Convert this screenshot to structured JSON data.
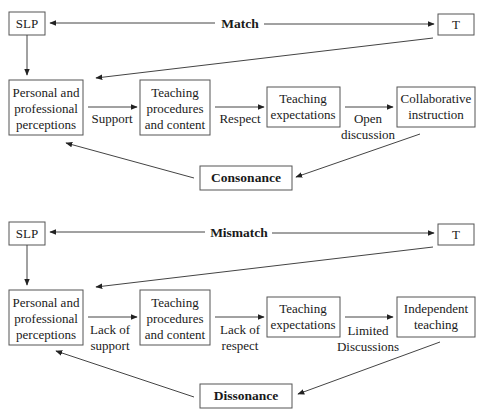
{
  "diagrams": [
    {
      "id": "match",
      "slp": "SLP",
      "t": "T",
      "relation": "Match",
      "nodes": [
        {
          "lines": [
            "Personal and",
            "professional",
            "perceptions"
          ]
        },
        {
          "lines": [
            "Teaching",
            "procedures",
            "and content"
          ]
        },
        {
          "lines": [
            "Teaching",
            "expectations"
          ]
        },
        {
          "lines": [
            "Collaborative",
            "instruction"
          ]
        }
      ],
      "edge_labels": [
        {
          "lines": [
            "Support"
          ]
        },
        {
          "lines": [
            "Respect"
          ]
        },
        {
          "lines": [
            "Open",
            "discussion"
          ]
        }
      ],
      "outcome": "Consonance"
    },
    {
      "id": "mismatch",
      "slp": "SLP",
      "t": "T",
      "relation": "Mismatch",
      "nodes": [
        {
          "lines": [
            "Personal and",
            "professional",
            "perceptions"
          ]
        },
        {
          "lines": [
            "Teaching",
            "procedures",
            "and content"
          ]
        },
        {
          "lines": [
            "Teaching",
            "expectations"
          ]
        },
        {
          "lines": [
            "Independent",
            "teaching"
          ]
        }
      ],
      "edge_labels": [
        {
          "lines": [
            "Lack of",
            "support"
          ]
        },
        {
          "lines": [
            "Lack of",
            "respect"
          ]
        },
        {
          "lines": [
            "Limited",
            "Discussions"
          ]
        }
      ],
      "outcome": "Dissonance"
    }
  ],
  "colors": {
    "stroke": "#555555",
    "text": "#1a1a1a",
    "background": "#ffffff"
  }
}
